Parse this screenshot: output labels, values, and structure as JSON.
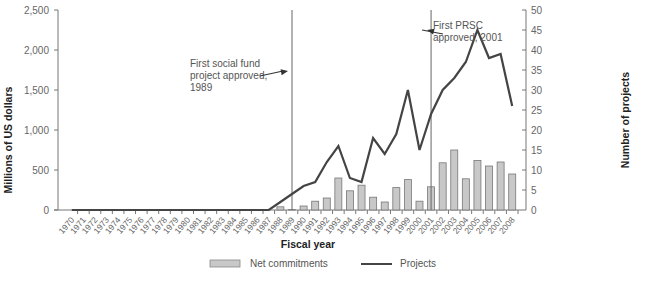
{
  "chart_data": {
    "type": "bar+line",
    "title": "",
    "xlabel": "Fiscal year",
    "ylabel": "Millions of US dollars",
    "y2label": "Number of projects",
    "ylim": [
      0,
      2500
    ],
    "y2lim": [
      0,
      50
    ],
    "yticks": [
      "0",
      "500",
      "1,000",
      "1,500",
      "2,000",
      "2,500"
    ],
    "y2ticks": [
      "0",
      "5",
      "10",
      "15",
      "20",
      "25",
      "30",
      "35",
      "40",
      "45",
      "50"
    ],
    "grid": false,
    "legend_position": "bottom",
    "categories": [
      "1970",
      "1971",
      "1972",
      "1973",
      "1974",
      "1975",
      "1976",
      "1977",
      "1978",
      "1979",
      "1980",
      "1981",
      "1982",
      "1983",
      "1984",
      "1985",
      "1986",
      "1987",
      "1988",
      "1989",
      "1990",
      "1991",
      "1992",
      "1993",
      "1994",
      "1995",
      "1996",
      "1997",
      "1998",
      "1999",
      "2000",
      "2001",
      "2002",
      "2003",
      "2004",
      "2005",
      "2006",
      "2007",
      "2008"
    ],
    "series": [
      {
        "name": "Net commitments",
        "type": "bar",
        "axis": "left",
        "color": "#c8c8c8",
        "values": [
          0,
          0,
          0,
          0,
          0,
          0,
          0,
          0,
          0,
          0,
          0,
          0,
          0,
          0,
          0,
          0,
          0,
          0,
          40,
          5,
          50,
          110,
          150,
          400,
          240,
          310,
          160,
          100,
          280,
          380,
          110,
          290,
          590,
          750,
          390,
          620,
          550,
          600,
          450
        ]
      },
      {
        "name": "Projects",
        "type": "line",
        "axis": "right",
        "color": "#444444",
        "values": [
          0,
          0,
          0,
          0,
          0,
          0,
          0,
          0,
          0,
          0,
          0,
          0,
          0,
          0,
          0,
          0,
          0,
          0,
          2,
          4,
          6,
          7,
          12,
          16,
          8,
          7,
          18,
          14,
          19,
          30,
          15,
          24,
          30,
          33,
          37,
          45,
          38,
          39,
          26
        ]
      }
    ],
    "annotations": [
      {
        "year": "1989",
        "text_lines": [
          "First social fund",
          "project approved,",
          "1989"
        ]
      },
      {
        "year": "2001",
        "text_lines": [
          "First PRSC",
          "approved, 2001"
        ]
      }
    ]
  },
  "legend": {
    "bar_label": "Net commitments",
    "line_label": "Projects"
  }
}
